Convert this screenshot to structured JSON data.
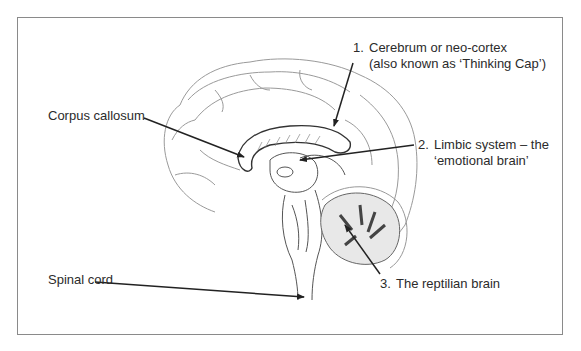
{
  "figure": {
    "labels": [
      {
        "id": "cerebrum",
        "number": "1.",
        "line1": "Cerebrum or neo-cortex",
        "line2": "(also known as ‘Thinking Cap’)"
      },
      {
        "id": "limbic",
        "number": "2.",
        "line1": "Limbic system – the",
        "line2": "‘emotional brain’"
      },
      {
        "id": "reptilian",
        "number": "3.",
        "line1": "The reptilian brain"
      },
      {
        "id": "corpus",
        "line1": "Corpus callosum"
      },
      {
        "id": "spinal",
        "line1": "Spinal cord"
      }
    ]
  },
  "colors": {
    "border": "#8a8a8a",
    "text": "#2b2b2b",
    "arrow": "#222222",
    "sketch": "#9a9a9a",
    "shade": "#555555"
  }
}
